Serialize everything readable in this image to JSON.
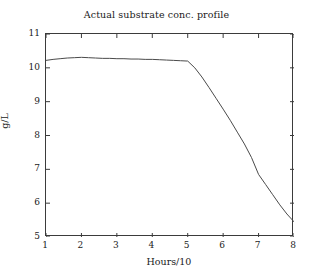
{
  "chart_data": {
    "type": "line",
    "title": "Actual substrate conc. profile",
    "xlabel": "Hours/10",
    "ylabel": "g/L",
    "xlim": [
      1,
      8
    ],
    "ylim": [
      5,
      11
    ],
    "xticks": [
      1,
      2,
      3,
      4,
      5,
      6,
      7,
      8
    ],
    "yticks": [
      5,
      6,
      7,
      8,
      9,
      10,
      11
    ],
    "grid": false,
    "legend": null,
    "line_color": "#4a4a4a",
    "background_color": "#ffffff",
    "axis_color": "#3b3b3b",
    "series": [
      {
        "name": "Actual substrate concentration",
        "x": [
          1.0,
          1.2,
          1.4,
          1.6,
          1.8,
          2.0,
          2.2,
          2.4,
          2.6,
          2.8,
          3.0,
          3.2,
          3.4,
          3.6,
          3.8,
          4.0,
          4.2,
          4.4,
          4.6,
          4.8,
          5.0,
          5.2,
          5.4,
          5.6,
          5.8,
          6.0,
          6.2,
          6.4,
          6.6,
          6.8,
          7.0,
          7.2,
          7.4,
          7.6,
          7.8,
          8.0
        ],
        "y": [
          10.22,
          10.25,
          10.27,
          10.29,
          10.3,
          10.31,
          10.3,
          10.29,
          10.28,
          10.28,
          10.27,
          10.27,
          10.26,
          10.26,
          10.25,
          10.25,
          10.24,
          10.23,
          10.22,
          10.21,
          10.2,
          10.0,
          9.73,
          9.42,
          9.1,
          8.78,
          8.45,
          8.1,
          7.75,
          7.35,
          6.85,
          6.55,
          6.25,
          5.95,
          5.68,
          5.45
        ]
      }
    ]
  },
  "axis_ticks": {
    "y": [
      "11",
      "10",
      "9",
      "8",
      "7",
      "6",
      "5"
    ],
    "x": [
      "1",
      "2",
      "3",
      "4",
      "5",
      "6",
      "7",
      "8"
    ]
  }
}
